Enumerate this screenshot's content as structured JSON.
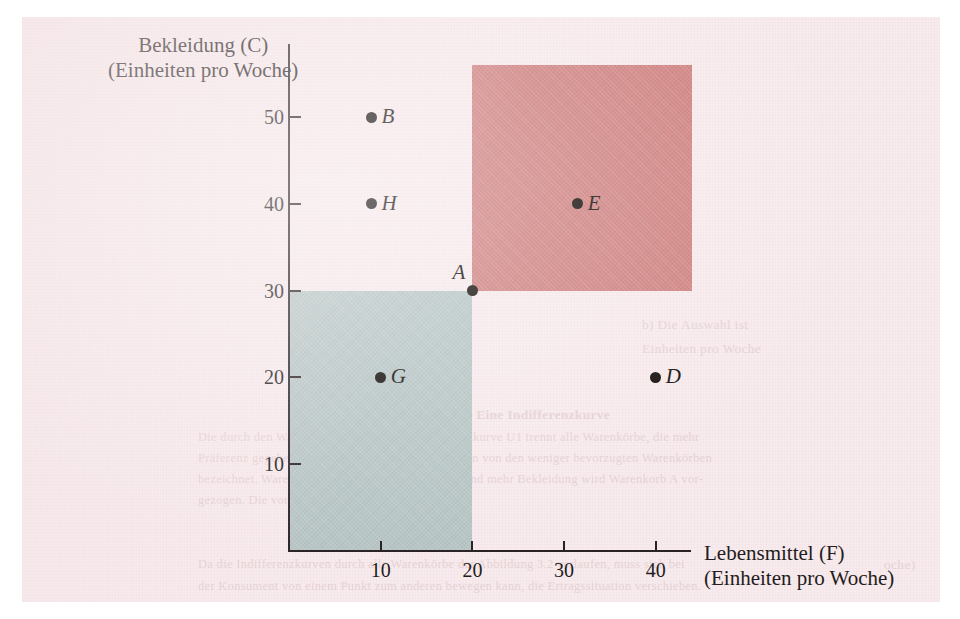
{
  "figure": {
    "background_color": "#f8ebed",
    "axis_color": "#2a2326",
    "point_color": "#16120f",
    "region_red_color": "#cd7a78",
    "region_blue_color": "#b3c3c3"
  },
  "chart_data": {
    "type": "scatter",
    "title": "",
    "xlabel": "Lebensmittel (F)",
    "xlabel_sub": "(Einheiten pro Woche)",
    "ylabel": "Bekleidung (C)",
    "ylabel_sub": "(Einheiten pro Woche)",
    "xlim": [
      0,
      44
    ],
    "ylim": [
      0,
      57
    ],
    "grid": false,
    "legend": null,
    "xticks": [
      10,
      20,
      30,
      40
    ],
    "yticks": [
      10,
      20,
      30,
      40,
      50
    ],
    "points": [
      {
        "label": "B",
        "x": 9,
        "y": 50,
        "label_side": "right"
      },
      {
        "label": "H",
        "x": 9,
        "y": 40,
        "label_side": "right"
      },
      {
        "label": "A",
        "x": 20,
        "y": 30,
        "label_side": "above-left"
      },
      {
        "label": "E",
        "x": 31.5,
        "y": 40,
        "label_side": "right"
      },
      {
        "label": "G",
        "x": 10,
        "y": 20,
        "label_side": "right"
      },
      {
        "label": "D",
        "x": 40,
        "y": 20,
        "label_side": "right"
      }
    ],
    "regions": [
      {
        "name": "preferred-to-A",
        "color": "#cd7a78",
        "x0": 20,
        "y0": 30,
        "x1": 44,
        "y1": 56
      },
      {
        "name": "less-preferred-than-A",
        "color": "#b3c3c3",
        "x0": 0,
        "y0": 0,
        "x1": 20,
        "y1": 30
      }
    ]
  },
  "bleed_text": {
    "right_col_1": "b) Die Auswahl ist",
    "right_col_2": "Einheiten pro Woche",
    "caption_line_0": "Abbildung 3.2: Eine Indifferenzkurve",
    "caption_line_1": "Die durch den Warenkorb A verlaufende Indifferenzkurve U1 trennt alle Warenkörbe, die mehr",
    "caption_line_2": "Präferenz gegeben werden wie Warenkorb A, werden von den weniger bevorzugten Warenkörben",
    "caption_line_3": "bezeichnet. Warenkorb E mit mehr Lebensmitteln und mehr Bekleidung wird Warenkorb A vor-",
    "caption_line_4": "gezogen. Die von ihr liegen.",
    "footer_line_1": "Da die Indifferenzkurven durch alle Warenkörbe der Abbildung 3.2 verlaufen, muss sich bei",
    "footer_line_2": "der Konsument von einem Punkt zum anderen bewegen kann, die Ertragssituation verschieben.",
    "tail_line": "oche)"
  }
}
